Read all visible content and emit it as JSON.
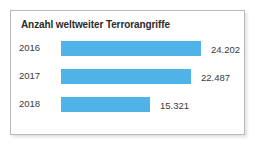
{
  "card": {
    "title": "Anzahl weltweiter Terrorangriffe"
  },
  "chart_data": {
    "type": "bar",
    "orientation": "horizontal",
    "title": "Anzahl weltweiter Terrorangriffe",
    "xlabel": "",
    "ylabel": "",
    "categories": [
      "2016",
      "2017",
      "2018"
    ],
    "values": [
      24202,
      22487,
      15321
    ],
    "value_labels": [
      "24.202",
      "22.487",
      "15.321"
    ],
    "xlim": [
      0,
      24202
    ],
    "grid": false,
    "legend": null,
    "series": [
      {
        "name": "Terrorangriffe",
        "color": "#4fb3e8",
        "values": [
          24202,
          22487,
          15321
        ]
      }
    ],
    "bars": [
      {
        "category": "2016",
        "value": 24202,
        "label": "24.202",
        "pct": 100.0
      },
      {
        "category": "2017",
        "value": 22487,
        "label": "22.487",
        "pct": 92.9
      },
      {
        "category": "2018",
        "value": 15321,
        "label": "15.321",
        "pct": 63.3
      }
    ]
  },
  "colors": {
    "bar": "#4fb3e8",
    "title_text": "#2b2b2b",
    "label_text": "#3a3a3a",
    "card_border": "#b9b9b9",
    "card_background": "#ffffff"
  }
}
